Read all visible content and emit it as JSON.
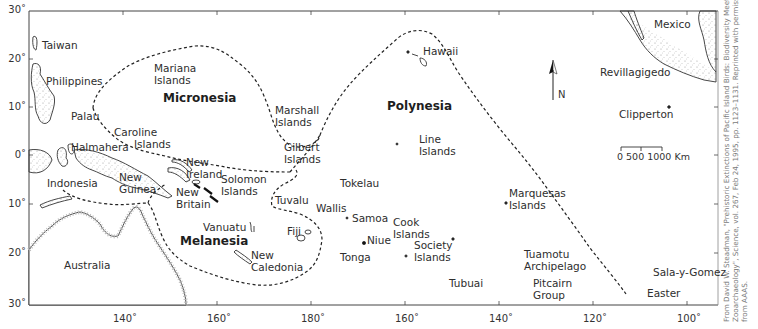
{
  "map": {
    "title": "Pacific Island Regions",
    "frame": {
      "left": 29,
      "right": 718,
      "top": 11,
      "bottom": 305
    },
    "latitude_ticks": [
      {
        "label": "30˚",
        "y": 11
      },
      {
        "label": "20˚",
        "y": 59
      },
      {
        "label": "10˚",
        "y": 107
      },
      {
        "label": "0˚",
        "y": 155
      },
      {
        "label": "10˚",
        "y": 204
      },
      {
        "label": "20˚",
        "y": 253
      },
      {
        "label": "30˚",
        "y": 305
      }
    ],
    "longitude_ticks": [
      {
        "label": "140˚",
        "x": 123
      },
      {
        "label": "160˚",
        "x": 217
      },
      {
        "label": "180˚",
        "x": 311
      },
      {
        "label": "160˚",
        "x": 405
      },
      {
        "label": "140˚",
        "x": 499
      },
      {
        "label": "120˚",
        "x": 593
      },
      {
        "label": "100˚",
        "x": 687
      }
    ],
    "regions": {
      "micronesia": "Micronesia",
      "melanesia": "Melanesia",
      "polynesia": "Polynesia"
    },
    "places": {
      "taiwan": "Taiwan",
      "philippines": "Philippines",
      "palau": "Palau",
      "halmahera": "Halmahera",
      "indonesia": "Indonesia",
      "new_guinea": "New\nGuinea",
      "australia": "Australia",
      "mariana": "Mariana\nIslands",
      "caroline": "Caroline\n      Islands",
      "marshall": "Marshall\nIslands",
      "gilbert": "Gilbert\nIslands",
      "new_ireland": "New\nIreland",
      "new_britain": "New\nBritain",
      "solomon": "Solomon\nIslands",
      "vanuatu": "Vanuatu",
      "new_caledonia": "New\nCaledonia",
      "fiji": "Fiji",
      "tuvalu": "Tuvalu",
      "wallis": "Wallis",
      "tokelau": "Tokelau",
      "samoa": "Samoa",
      "niue": "Niue",
      "tonga": "Tonga",
      "cook": "Cook\nIslands",
      "society": "Society\nIslands",
      "tubuai": "Tubuai",
      "hawaii": "Hawaii",
      "line": "Line\nIslands",
      "marquesas": "Marquesas\nIslands",
      "tuamotu": "Tuamotu\nArchipelago",
      "pitcairn": "Pitcairn\nGroup",
      "easter": "Easter",
      "sala_y_gomez": "Sala-y-Gomez",
      "mexico": "Mexico",
      "revillagigedo": "Revillagigedo",
      "clipperton": "Clipperton"
    },
    "north_arrow": {
      "label": "N"
    },
    "scale_bar": {
      "label": "0   500 1000 Km",
      "unit": "Km",
      "marks": [
        "0",
        "500",
        "1000"
      ]
    },
    "citation": "From David W. Steadman, \"Prehistoric Extinctions of Pacific Island Birds: Biodiversity Meets\nZooarchaeology\", Science, vol. 267, Feb 24, 1995, pp. 1123–1131. Reprinted with permission\nfrom AAAS."
  }
}
